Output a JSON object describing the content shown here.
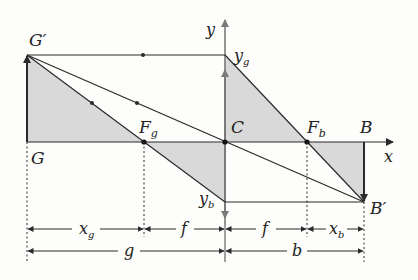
{
  "diagram": {
    "type": "thin-lens-ray-construction",
    "colors": {
      "line": "#2a2a2a",
      "shade": "#d9d9d9",
      "lens_axis": "#7a7a7a",
      "background": "#fdfdfb"
    },
    "points": {
      "G_prime": "G′",
      "G": "G",
      "F_g": "F",
      "F_g_sub": "g",
      "C": "C",
      "F_b": "F",
      "F_b_sub": "b",
      "B": "B",
      "B_prime": "B′",
      "y_g": "y",
      "y_g_sub": "g",
      "y_b": "y",
      "y_b_sub": "b"
    },
    "axes": {
      "x": "x",
      "y": "y"
    },
    "dimensions": {
      "row1": [
        {
          "label": "x",
          "sub": "g"
        },
        {
          "label": "f",
          "sub": ""
        },
        {
          "label": "f",
          "sub": ""
        },
        {
          "label": "x",
          "sub": "b"
        }
      ],
      "row2": [
        {
          "label": "g",
          "sub": ""
        },
        {
          "label": "b",
          "sub": ""
        }
      ]
    }
  }
}
